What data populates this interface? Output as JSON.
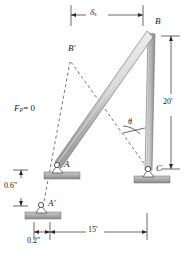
{
  "figure": {
    "kind": "engineering-statics-frame-diagram",
    "caption": "",
    "background_color": "#ffffff",
    "ink_color": "#1a1a1a",
    "member_fill_light": "#d8d8d8",
    "member_fill_mid": "#b4b4b4",
    "member_fill_dark": "#8e8e8e",
    "ground_hatch_color": "#9a9a9a"
  },
  "labels": {
    "delta_top": "δ",
    "delta_top_sub": "s",
    "point_B": "B",
    "point_B_prime": "B′",
    "point_A": "A",
    "point_A_prime": "A′",
    "point_C": "C",
    "theta": "θ",
    "force_p": "F",
    "force_p_sub": "P",
    "force_p_value": "= 0",
    "dim_height": "20′",
    "dim_span": "15′",
    "dim_drop": "0.6″",
    "dim_shift": "0.2″"
  },
  "dimensions": [
    {
      "name": "delta-s",
      "label": "δs",
      "orientation": "horizontal",
      "position": "top"
    },
    {
      "name": "height",
      "label": "20'",
      "orientation": "vertical",
      "position": "right"
    },
    {
      "name": "span",
      "label": "15'",
      "orientation": "horizontal",
      "position": "bottom"
    },
    {
      "name": "drop",
      "label": "0.6\"",
      "orientation": "vertical",
      "position": "left"
    },
    {
      "name": "shift",
      "label": "0.2\"",
      "orientation": "horizontal",
      "position": "bottom-left"
    }
  ],
  "nodes": [
    {
      "name": "A",
      "x": 57,
      "y": 166
    },
    {
      "name": "A'",
      "x": 43,
      "y": 205
    },
    {
      "name": "B",
      "x": 151,
      "y": 33
    },
    {
      "name": "B'",
      "x": 70,
      "y": 58
    },
    {
      "name": "C",
      "x": 149,
      "y": 170
    }
  ],
  "members": [
    {
      "name": "diagonal-AB",
      "from": "A",
      "to": "B",
      "style": "solid-shaded"
    },
    {
      "name": "column-BC",
      "from": "B",
      "to": "C",
      "style": "solid-shaded"
    }
  ],
  "construction_lines": [
    {
      "name": "line-Aprime-Bprime",
      "from": "A'",
      "to": "B'",
      "style": "dashed"
    },
    {
      "name": "line-Bprime-C",
      "from": "B'",
      "to": "C",
      "style": "dashed"
    }
  ],
  "supports": [
    {
      "name": "pin-support-A",
      "at": "A"
    },
    {
      "name": "pin-support-A-prime",
      "at": "A'"
    },
    {
      "name": "pin-support-C",
      "at": "C"
    }
  ]
}
